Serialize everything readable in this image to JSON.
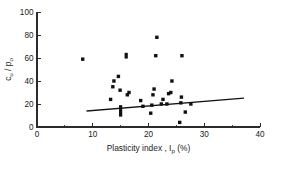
{
  "chart_data": {
    "type": "scatter",
    "title": "",
    "xlabel": "Plasticity index , I_p (%)",
    "ylabel": "c_u / p_o",
    "xlabel_parts": {
      "main": "Plasticity index , I",
      "sub": "p",
      "tail": " (%)"
    },
    "ylabel_parts": {
      "main": "c",
      "sub1": "u",
      "mid": " / p",
      "sub2": "o"
    },
    "xlim": [
      0,
      40
    ],
    "ylim": [
      0,
      100
    ],
    "xticks": [
      0,
      10,
      20,
      30,
      40
    ],
    "xticklabels": [
      "0",
      "10",
      "20",
      "30",
      "40"
    ],
    "xticks_minor": [
      5,
      15,
      25,
      35
    ],
    "yticks": [
      0,
      20,
      40,
      60,
      80,
      100
    ],
    "yticklabels": [
      "0",
      "20",
      "40",
      "60",
      "80",
      "100"
    ],
    "grid": false,
    "legend": null,
    "marker_color": "#111111",
    "line_color": "#111111",
    "points": [
      {
        "x": 8.2,
        "y": 59
      },
      {
        "x": 13.2,
        "y": 24
      },
      {
        "x": 13.6,
        "y": 35
      },
      {
        "x": 13.8,
        "y": 40
      },
      {
        "x": 14.6,
        "y": 44
      },
      {
        "x": 14.9,
        "y": 32
      },
      {
        "x": 15.0,
        "y": 14,
        "shape": "vbar",
        "height": 10
      },
      {
        "x": 16.0,
        "y": 62,
        "shape": "vbar",
        "height": 5
      },
      {
        "x": 16.2,
        "y": 28
      },
      {
        "x": 16.5,
        "y": 30
      },
      {
        "x": 18.6,
        "y": 23
      },
      {
        "x": 19.0,
        "y": 18
      },
      {
        "x": 20.4,
        "y": 12
      },
      {
        "x": 20.6,
        "y": 19
      },
      {
        "x": 20.8,
        "y": 28
      },
      {
        "x": 21.0,
        "y": 33
      },
      {
        "x": 21.3,
        "y": 62
      },
      {
        "x": 21.5,
        "y": 78
      },
      {
        "x": 22.3,
        "y": 20
      },
      {
        "x": 22.6,
        "y": 24
      },
      {
        "x": 23.3,
        "y": 20
      },
      {
        "x": 23.6,
        "y": 29
      },
      {
        "x": 24.0,
        "y": 30
      },
      {
        "x": 24.2,
        "y": 40
      },
      {
        "x": 25.6,
        "y": 4
      },
      {
        "x": 25.8,
        "y": 21
      },
      {
        "x": 25.9,
        "y": 26
      },
      {
        "x": 26.0,
        "y": 62
      },
      {
        "x": 26.6,
        "y": 13
      },
      {
        "x": 27.6,
        "y": 20
      }
    ],
    "trend_line": {
      "x1": 9.0,
      "y1": 14.0,
      "x2": 37.0,
      "y2": 25.0
    }
  }
}
